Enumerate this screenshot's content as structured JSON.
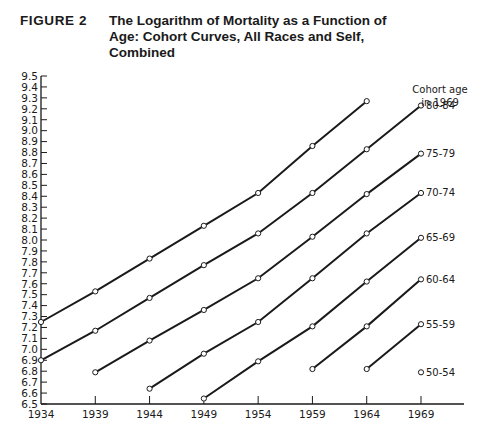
{
  "figure": {
    "label": "FIGURE  2",
    "title_lines": [
      "The Logarithm of Mortality as a Function of",
      "Age: Cohort Curves, All Races and Self,",
      "Combined"
    ]
  },
  "legend": {
    "title_lines": [
      "Cohort age",
      "in 1969"
    ]
  },
  "colors": {
    "line": "#1a1a1a",
    "marker_fill": "#ffffff",
    "background": "#ffffff"
  },
  "chart_data": {
    "type": "line",
    "title": "The Logarithm of Mortality as a Function of Age: Cohort Curves, All Races and Self, Combined",
    "xlabel": "",
    "ylabel": "",
    "x": [
      1934,
      1939,
      1944,
      1949,
      1954,
      1959,
      1964,
      1969
    ],
    "xticks": [
      "1934",
      "1939",
      "1944",
      "1949",
      "1954",
      "1959",
      "1964",
      "1969"
    ],
    "yticks": [
      "6.5",
      "6.6",
      "6.7",
      "6.8",
      "6.9",
      "7.0",
      "7.1",
      "7.2",
      "7.3",
      "7.4",
      "7.5",
      "7.6",
      "7.7",
      "7.8",
      "7.9",
      "8.0",
      "8.1",
      "8.2",
      "8.3",
      "8.4",
      "8.5",
      "8.6",
      "8.7",
      "8.8",
      "8.9",
      "9.0",
      "9.1",
      "9.2",
      "9.3",
      "9.4",
      "9.5"
    ],
    "ylim": [
      6.5,
      9.5
    ],
    "xlim": [
      1934,
      1973
    ],
    "grid": false,
    "legend_position": "right, labels at series end",
    "legend_title": "Cohort age in 1969",
    "series": [
      {
        "name": "",
        "x": [
          1934,
          1939,
          1944,
          1949,
          1954,
          1959,
          1964
        ],
        "values": [
          7.25,
          7.53,
          7.83,
          8.13,
          8.43,
          8.86,
          9.27
        ]
      },
      {
        "name": "80-84",
        "x": [
          1934,
          1939,
          1944,
          1949,
          1954,
          1959,
          1964,
          1969
        ],
        "values": [
          6.9,
          7.17,
          7.47,
          7.77,
          8.06,
          8.43,
          8.83,
          9.23
        ]
      },
      {
        "name": "75-79",
        "x": [
          1939,
          1944,
          1949,
          1954,
          1959,
          1964,
          1969
        ],
        "values": [
          6.79,
          7.08,
          7.36,
          7.65,
          8.03,
          8.42,
          8.79
        ]
      },
      {
        "name": "70-74",
        "x": [
          1944,
          1949,
          1954,
          1959,
          1964,
          1969
        ],
        "values": [
          6.64,
          6.96,
          7.25,
          7.65,
          8.06,
          8.43
        ]
      },
      {
        "name": "65-69",
        "x": [
          1949,
          1954,
          1959,
          1964,
          1969
        ],
        "values": [
          6.55,
          6.89,
          7.21,
          7.62,
          8.02
        ]
      },
      {
        "name": "60-64",
        "x": [
          1959,
          1964,
          1969
        ],
        "values": [
          6.82,
          7.21,
          7.64
        ]
      },
      {
        "name": "55-59",
        "x": [
          1964,
          1969
        ],
        "values": [
          6.82,
          7.23
        ]
      },
      {
        "name": "50-54",
        "x": [
          1969
        ],
        "values": [
          6.79
        ]
      }
    ]
  }
}
